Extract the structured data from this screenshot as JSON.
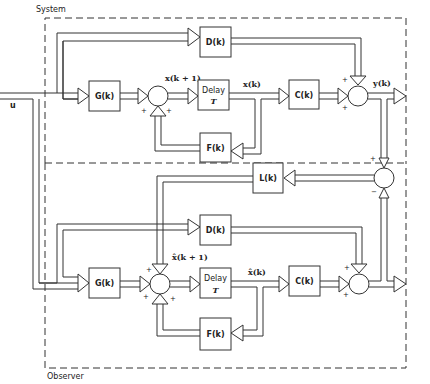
{
  "diagram": {
    "type": "block-diagram",
    "title_labels": {
      "system": "System",
      "observer": "Observer"
    },
    "input": {
      "label": "u"
    },
    "system": {
      "blocks": {
        "G": "G(k)",
        "delay_line1": "Delay",
        "delay_line2": "T",
        "C": "C(k)",
        "D": "D(k)",
        "F": "F(k)"
      },
      "signals": {
        "x_next": "x(k + 1)",
        "x": "x(k)",
        "y": "y(k)"
      },
      "signs": {
        "sum1_left": "+",
        "sum1_bottom": "+",
        "sum2_top": "+",
        "sum2_bottom": "+"
      }
    },
    "error_junction": {
      "block_L": "L(k)",
      "sign_top": "+",
      "sign_bottom": "−"
    },
    "observer": {
      "blocks": {
        "G": "G(k)",
        "delay_line1": "Delay",
        "delay_line2": "T",
        "C": "C(k)",
        "D": "D(k)",
        "F": "F(k)"
      },
      "signals": {
        "xhat_next": "x̂(k + 1)",
        "xhat": "x̂(k)"
      },
      "signs": {
        "sum1_top": "+",
        "sum1_left": "+",
        "sum1_bottom": "+",
        "sum2_top": "+",
        "sum2_bottom": "+"
      }
    },
    "nodes": [
      "u",
      "G(k)",
      "sum",
      "Delay T",
      "C(k)",
      "sum",
      "y(k)",
      "D(k)",
      "F(k)",
      "L(k)",
      "error-sum",
      "G(k) obs",
      "sum obs",
      "Delay T obs",
      "C(k) obs",
      "sum obs out",
      "D(k) obs",
      "F(k) obs"
    ],
    "edges": [
      [
        "u",
        "G(k)"
      ],
      [
        "u",
        "D(k)"
      ],
      [
        "G(k)",
        "sum"
      ],
      [
        "sum",
        "Delay T"
      ],
      [
        "Delay T",
        "C(k)"
      ],
      [
        "Delay T",
        "F(k)"
      ],
      [
        "F(k)",
        "sum"
      ],
      [
        "C(k)",
        "sum-out"
      ],
      [
        "D(k)",
        "sum-out"
      ],
      [
        "sum-out",
        "y(k)"
      ],
      [
        "y(k)",
        "error-sum"
      ],
      [
        "obs-out",
        "error-sum"
      ],
      [
        "error-sum",
        "L(k)"
      ],
      [
        "L(k)",
        "sum obs"
      ],
      [
        "u",
        "G(k) obs"
      ],
      [
        "u",
        "D(k) obs"
      ],
      [
        "G(k) obs",
        "sum obs"
      ],
      [
        "sum obs",
        "Delay T obs"
      ],
      [
        "Delay T obs",
        "C(k) obs"
      ],
      [
        "Delay T obs",
        "F(k) obs"
      ],
      [
        "F(k) obs",
        "sum obs"
      ],
      [
        "C(k) obs",
        "sum obs out"
      ],
      [
        "D(k) obs",
        "sum obs out"
      ]
    ]
  }
}
